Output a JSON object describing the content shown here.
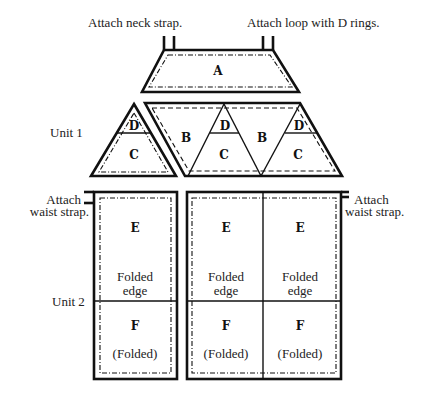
{
  "diagram": {
    "annotations": {
      "neck_strap": "Attach neck strap.",
      "loop_d_rings": "Attach loop with D rings.",
      "unit1": "Unit 1",
      "unit2": "Unit 2",
      "waist_left_line1": "Attach",
      "waist_left_line2": "waist strap.",
      "waist_right_line1": "Attach",
      "waist_right_line2": "waist strap."
    },
    "pieces": {
      "a": "A",
      "left_triangle": {
        "top": "D",
        "bottom": "C"
      },
      "strip": {
        "b1": "B",
        "tri1_top": "D",
        "tri1_bottom": "C",
        "b2": "B",
        "tri2_top": "D",
        "tri2_bottom": "C"
      }
    },
    "panels": [
      {
        "top": "E",
        "fold_line1": "Folded",
        "fold_line2": "edge",
        "bottom": "F",
        "bottom_note": "(Folded)"
      },
      {
        "top": "E",
        "fold_line1": "Folded",
        "fold_line2": "edge",
        "bottom": "F",
        "bottom_note": "(Folded)"
      },
      {
        "top": "E",
        "fold_line1": "Folded",
        "fold_line2": "edge",
        "bottom": "F",
        "bottom_note": "(Folded)"
      }
    ],
    "colors": {
      "line": "#111111",
      "background": "#ffffff"
    }
  }
}
